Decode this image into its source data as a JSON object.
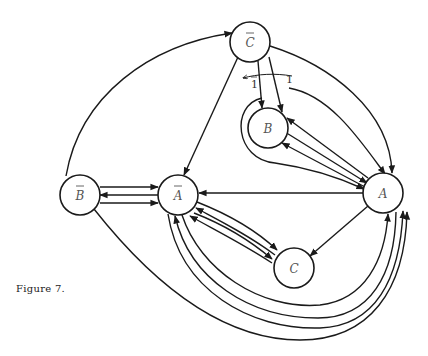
{
  "caption": "Figure 7.",
  "colors": {
    "ink": "#1a1a1a",
    "label": "#555555",
    "background": "#ffffff"
  },
  "nodes": [
    {
      "id": "Cbar",
      "label": "C",
      "overbar": true,
      "x": 250,
      "y": 42
    },
    {
      "id": "B",
      "label": "B",
      "overbar": false,
      "x": 268,
      "y": 128
    },
    {
      "id": "Bbar",
      "label": "B",
      "overbar": true,
      "x": 80,
      "y": 195
    },
    {
      "id": "Abar",
      "label": "A",
      "overbar": true,
      "x": 178,
      "y": 195
    },
    {
      "id": "A",
      "label": "A",
      "overbar": false,
      "x": 383,
      "y": 193
    },
    {
      "id": "C",
      "label": "C",
      "overbar": false,
      "x": 294,
      "y": 268
    }
  ],
  "edge_labels": {
    "one": "1",
    "one_bar": "1"
  },
  "edges": [
    {
      "from": "Bbar",
      "to": "Cbar",
      "count": 1
    },
    {
      "from": "Cbar",
      "to": "Abar",
      "count": 1
    },
    {
      "from": "Cbar",
      "to": "B",
      "count": 2,
      "labels": [
        "1",
        "1̄"
      ]
    },
    {
      "from": "Cbar",
      "to": "A",
      "count": 1
    },
    {
      "from": "Bbar",
      "to": "Abar",
      "count": 2
    },
    {
      "from": "Abar",
      "to": "Bbar",
      "count": 1
    },
    {
      "from": "A",
      "to": "B",
      "count": 2
    },
    {
      "from": "B",
      "to": "A",
      "count": 1
    },
    {
      "from": "B",
      "to": "A",
      "via": "loop-around-B",
      "count": 1
    },
    {
      "from": "A",
      "to": "Abar",
      "count": 1
    },
    {
      "from": "A",
      "to": "C",
      "count": 1
    },
    {
      "from": "Abar",
      "to": "C",
      "count": 2
    },
    {
      "from": "C",
      "to": "Abar",
      "count": 2
    },
    {
      "from": "Abar",
      "to": "A",
      "via": "below-C",
      "count": 2
    },
    {
      "from": "A",
      "to": "Abar",
      "via": "below-C",
      "count": 1
    },
    {
      "from": "Bbar",
      "to": "A",
      "via": "bottom",
      "count": 1
    }
  ]
}
